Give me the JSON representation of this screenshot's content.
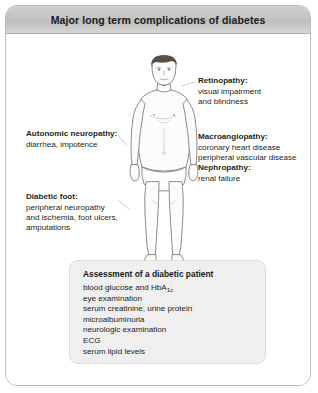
{
  "title": "Major long term complications of diabetes",
  "annotations": [
    {
      "id": "retinopathy",
      "heading": "Retinopathy:",
      "lines": [
        "visual impairment",
        "and blindness"
      ]
    },
    {
      "id": "autonomic-neuropathy",
      "heading": "Autonomic neuropathy:",
      "lines": [
        "diarrhea, impotence"
      ]
    },
    {
      "id": "macroangiopathy",
      "heading": "Macroangiopathy:",
      "lines": [
        "coronary heart disease",
        "peripheral vascular disease"
      ]
    },
    {
      "id": "nephropathy",
      "heading": "Nephropathy:",
      "lines": [
        "renal failure"
      ]
    },
    {
      "id": "diabetic-foot",
      "heading": "Diabetic foot:",
      "lines": [
        "peripheral neuropathy",
        "and ischemia, foot ulcers,",
        "amputations"
      ]
    }
  ],
  "assessment": {
    "heading": "Assessment of a diabetic patient",
    "items": [
      {
        "text": "blood glucose and HbA",
        "sub": "1c",
        "after": ""
      },
      {
        "text": "eye examination"
      },
      {
        "text": "serum creatinine, urine protein"
      },
      {
        "text": "microalbuminuria"
      },
      {
        "text": "neurologic examination"
      },
      {
        "text": "ECG"
      },
      {
        "text": "serum lipid levels"
      }
    ]
  },
  "figure": {
    "name": "anatomical-male-figure",
    "skin_color": "#fbfbfb",
    "outline_color": "#6d6e71",
    "hair_color": "#5a5047"
  },
  "colors": {
    "frame_border": "#b9b9b9",
    "titlebar_top": "#cfcfcf",
    "titlebar_bottom": "#d6d6d6",
    "assessbox_fill": "#efefef",
    "text": "#231f20"
  }
}
